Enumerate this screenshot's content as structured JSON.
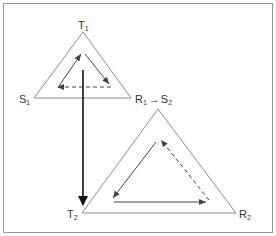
{
  "diagram": {
    "colors": {
      "frame": "#9a9a9a",
      "triangle": "#8a8a8a",
      "arrow": "#444444",
      "main_arrow": "#111111",
      "text": "#333333"
    },
    "triangles": [
      {
        "id": "triangle-1",
        "vertices": {
          "top": {
            "label": "T",
            "sub": "1"
          },
          "left": {
            "label": "S",
            "sub": "1"
          },
          "right": {
            "label": "R",
            "sub": "1",
            "arrow": "→",
            "label2": "S",
            "sub2": "2"
          }
        },
        "inner_cycle": [
          "S1 → T1 (solid)",
          "T1 → R1 (solid)",
          "R1 → S1 (dashed)"
        ]
      },
      {
        "id": "triangle-2",
        "vertices": {
          "top": {
            "label": "S",
            "sub": "2"
          },
          "left": {
            "label": "T",
            "sub": "2"
          },
          "right": {
            "label": "R",
            "sub": "2"
          }
        },
        "inner_cycle": [
          "S2 → T2 (solid)",
          "T2 → R2 (solid)",
          "R2 → S2 (dashed)"
        ]
      }
    ],
    "connector": {
      "from": "T1",
      "to": "T2",
      "style": "bold solid"
    }
  }
}
